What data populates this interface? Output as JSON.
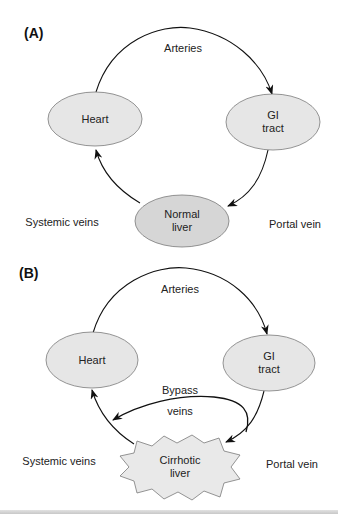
{
  "colors": {
    "node_fill": "#e6e6e6",
    "normal_liver_fill": "#d6d6d6",
    "cirrhotic_liver_fill": "#e9e9e9",
    "stroke": "#7a7a7a",
    "arrow": "#111111"
  },
  "panels": [
    {
      "label": "(A)",
      "nodes": {
        "heart": "Heart",
        "gi_line1": "GI",
        "gi_line2": "tract",
        "liver_line1": "Normal",
        "liver_line2": "liver"
      },
      "edges": {
        "arteries": "Arteries",
        "systemic": "Systemic veins",
        "portal": "Portal vein"
      }
    },
    {
      "label": "(B)",
      "nodes": {
        "heart": "Heart",
        "gi_line1": "GI",
        "gi_line2": "tract",
        "liver_line1": "Cirrhotic",
        "liver_line2": "liver"
      },
      "edges": {
        "arteries": "Arteries",
        "bypass_line1": "Bypass",
        "bypass_line2": "veins",
        "systemic": "Systemic veins",
        "portal": "Portal vein"
      }
    }
  ]
}
